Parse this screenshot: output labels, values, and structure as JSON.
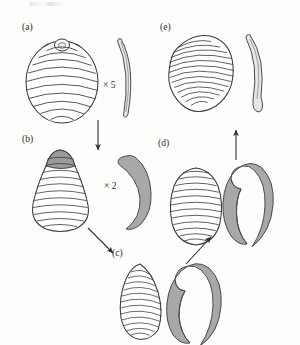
{
  "figure": {
    "kind": "scientific-line-drawing",
    "caption_labels": {
      "a": "(a)",
      "b": "(b)",
      "c": "(c)",
      "d": "(d)",
      "e": "(e)"
    },
    "magnifications": {
      "a_to_b": "× 5",
      "b_to_c": "× 2"
    },
    "colors": {
      "background": "#fdfdfc",
      "ink": "#2b2b2b",
      "outline": "#3a3a3a",
      "hook_fill": "#a8a8a8",
      "hook_fill_light": "#bdbdbd",
      "shell_shade": "#9a9a9a",
      "arrow": "#2f2f2f"
    },
    "panels": [
      {
        "id": "a",
        "label": "(a)",
        "shell": {
          "shape": "globular-rounded",
          "rings": 10,
          "apex": "small knob",
          "cx": 62,
          "cy": 80,
          "rx": 36,
          "ry": 42
        },
        "hook": {
          "style": "slender-crescent-outline",
          "fill": "none"
        }
      },
      {
        "id": "b",
        "label": "(b)",
        "shell": {
          "shape": "pear-teardrop",
          "rings": 11,
          "apex": "shaded cap",
          "cx": 60,
          "cy": 190,
          "rx": 30,
          "ry": 42
        },
        "hook": {
          "style": "curved-claw-filled",
          "fill": "#a8a8a8"
        }
      },
      {
        "id": "c",
        "label": "(c)",
        "shell": {
          "shape": "elongate-mussel",
          "rings": 14,
          "apex": "pointed",
          "cx": 140,
          "cy": 300,
          "rx": 24,
          "ry": 38
        },
        "hook": {
          "style": "hooked-claw-curled-head",
          "fill": "#a8a8a8"
        }
      },
      {
        "id": "d",
        "label": "(d)",
        "shell": {
          "shape": "ovate",
          "rings": 13,
          "apex": "rounded",
          "cx": 196,
          "cy": 205,
          "rx": 25,
          "ry": 38
        },
        "hook": {
          "style": "hooked-claw-curled-head",
          "fill": "#a8a8a8"
        }
      },
      {
        "id": "e",
        "label": "(e)",
        "shell": {
          "shape": "broad-ovate-tilted",
          "rings": 16,
          "apex": "rounded-left",
          "cx": 200,
          "cy": 72,
          "rx": 31,
          "ry": 38
        },
        "hook": {
          "style": "slender-crescent-outline",
          "fill": "none"
        }
      }
    ],
    "arrows": [
      {
        "id": "a-to-b",
        "from": "a",
        "to": "b",
        "direction": "down",
        "x1": 98,
        "y1": 120,
        "x2": 98,
        "y2": 152
      },
      {
        "id": "b-to-c",
        "from": "b",
        "to": "c",
        "direction": "down-right",
        "x1": 88,
        "y1": 228,
        "x2": 116,
        "y2": 256
      },
      {
        "id": "c-to-d",
        "from": "c",
        "to": "d",
        "direction": "up-right",
        "x1": 186,
        "y1": 264,
        "x2": 214,
        "y2": 234
      },
      {
        "id": "d-to-e",
        "from": "d",
        "to": "e",
        "direction": "up",
        "x1": 236,
        "y1": 160,
        "x2": 236,
        "y2": 128
      }
    ]
  }
}
